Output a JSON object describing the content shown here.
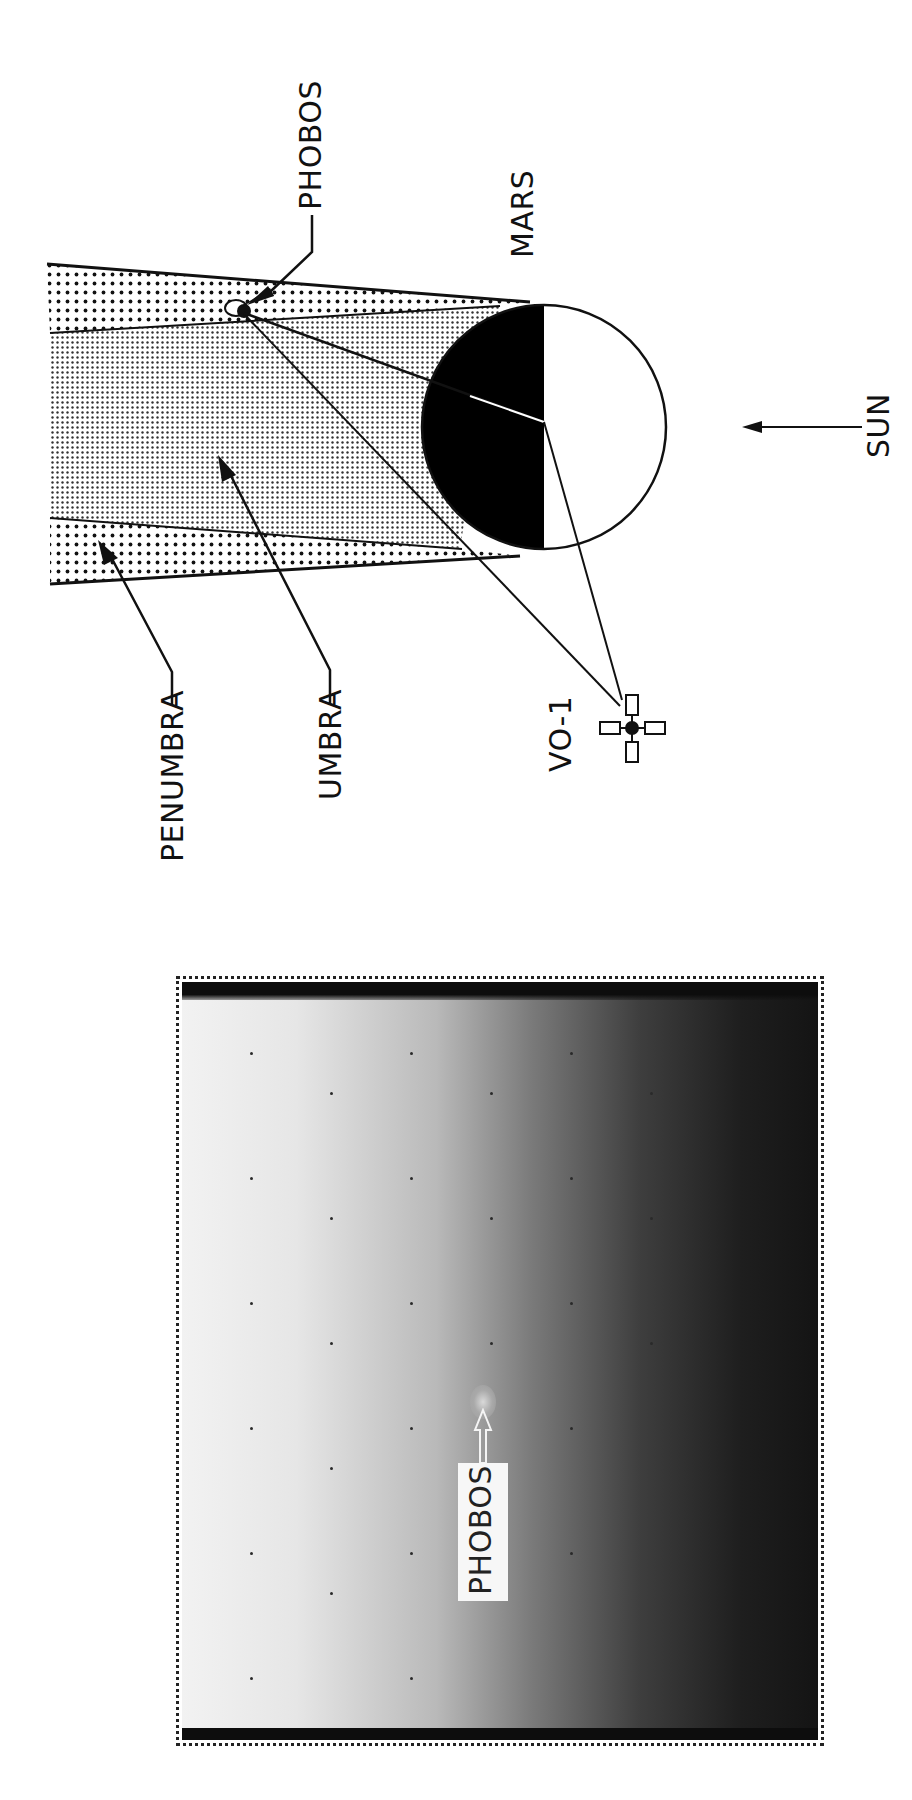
{
  "diagram": {
    "labels": {
      "phobos": "PHOBOS",
      "mars": "MARS",
      "sun": "SUN",
      "penumbra": "PENUMBRA",
      "umbra": "UMBRA",
      "spacecraft": "VO-1"
    },
    "colors": {
      "ink": "#111111",
      "mars_night": "#000000",
      "mars_day": "#ffffff",
      "umbra_fill": "#d6d6d6",
      "penumbra_fill": "#ffffff"
    }
  },
  "photo": {
    "label": "PHOBOS",
    "gradient": "light-left-to-dark-right"
  }
}
